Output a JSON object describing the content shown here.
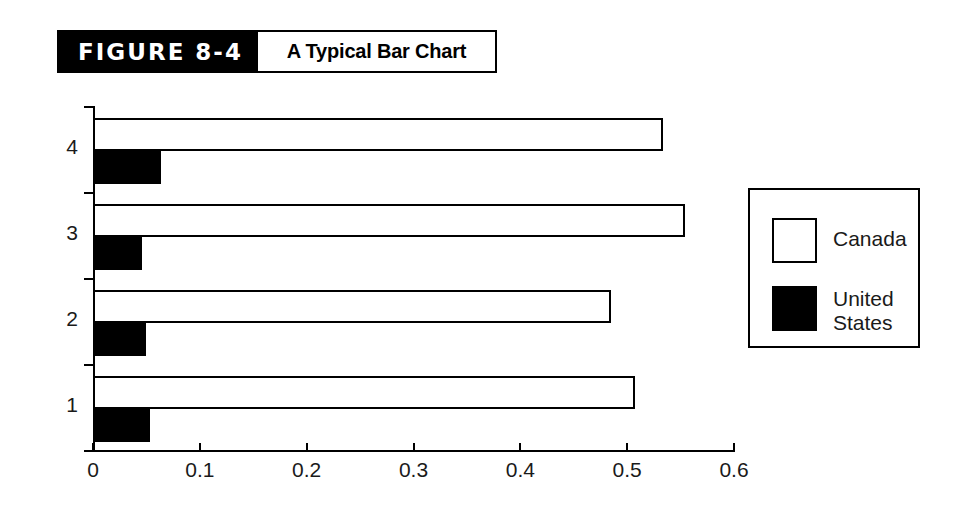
{
  "figure": {
    "number_label": "FIGURE 8-4",
    "caption": "A Typical Bar Chart"
  },
  "legend": {
    "position": "right",
    "entries": [
      {
        "label": "Canada",
        "swatch": "hollow-square",
        "color": "#ffffff"
      },
      {
        "label": "United\nStates",
        "swatch": "filled-square",
        "color": "#000000"
      }
    ]
  },
  "axes": {
    "x_ticks": [
      "0",
      "0.1",
      "0.2",
      "0.3",
      "0.4",
      "0.5",
      "0.6"
    ],
    "y_ticks": [
      "4",
      "3",
      "2",
      "1"
    ]
  },
  "chart_data": {
    "type": "bar",
    "orientation": "horizontal",
    "title": "A Typical Bar Chart",
    "categories": [
      "1",
      "2",
      "3",
      "4"
    ],
    "series": [
      {
        "name": "Canada",
        "values": [
          0.507,
          0.485,
          0.554,
          0.534
        ],
        "color": "#ffffff"
      },
      {
        "name": "United States",
        "values": [
          0.053,
          0.05,
          0.046,
          0.064
        ],
        "color": "#000000"
      }
    ],
    "xlabel": "",
    "ylabel": "",
    "xlim": [
      0,
      0.6
    ],
    "xticks": [
      0,
      0.1,
      0.2,
      0.3,
      0.4,
      0.5,
      0.6
    ],
    "grid": false,
    "legend_position": "right"
  }
}
